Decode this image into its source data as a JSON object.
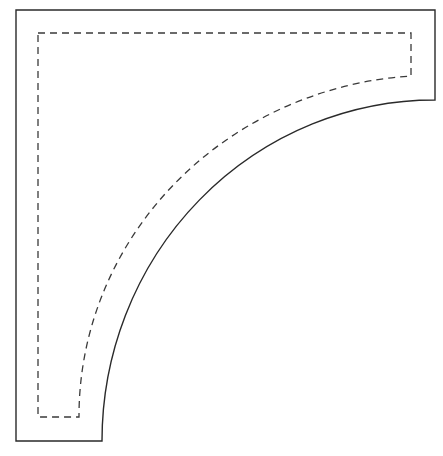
{
  "diagram": {
    "title": "",
    "shapes": [
      {
        "id": "outer-cut-line",
        "style": "solid",
        "description": "Outer outline of quarter-circle corner piece"
      },
      {
        "id": "inner-seam-line",
        "style": "dashed",
        "description": "Inner dashed seam/stitch line offset inside the outline"
      }
    ],
    "colors": {
      "line": "#2a2a2a",
      "background": "#ffffff"
    }
  }
}
